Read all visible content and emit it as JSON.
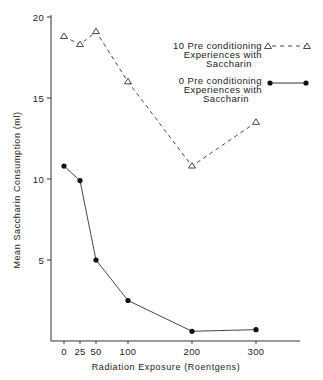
{
  "chart_data": {
    "type": "line",
    "title": "",
    "xlabel": "Radiation Exposure (Roentgens)",
    "ylabel": "Mean Saccharin Consumption (ml)",
    "x": [
      0,
      25,
      50,
      100,
      200,
      300
    ],
    "x_ticks": [
      "0",
      "25",
      "50",
      "100",
      "200",
      "300"
    ],
    "y_ticks": [
      "5",
      "10",
      "15",
      "20"
    ],
    "xlim": [
      0,
      300
    ],
    "ylim": [
      0,
      20
    ],
    "grid": false,
    "legend_position": "upper right",
    "series": [
      {
        "name": "10 Pre conditioning Experiences with Saccharin",
        "legend_lines": [
          "10 Pre conditioning",
          "Experiences with",
          "Saccharin"
        ],
        "marker": "open-triangle",
        "line_style": "dashed",
        "values": [
          18.8,
          18.3,
          19.1,
          16.0,
          10.8,
          13.5
        ]
      },
      {
        "name": "0 Pre conditioning Experiences with Saccharin",
        "legend_lines": [
          "0 Pre conditioning",
          "Experiences with",
          "Saccharin"
        ],
        "marker": "filled-circle",
        "line_style": "solid",
        "values": [
          10.8,
          9.9,
          5.0,
          2.5,
          0.6,
          0.7
        ]
      }
    ]
  }
}
